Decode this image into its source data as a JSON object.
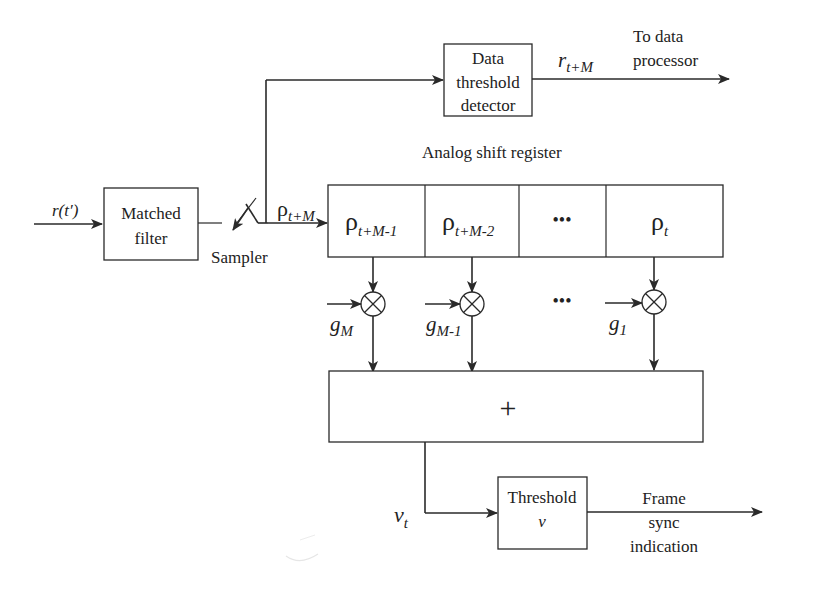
{
  "diagram": {
    "type": "block-diagram",
    "input": {
      "label": "r(t′)"
    },
    "matched_filter": {
      "line1": "Matched",
      "line2": "filter"
    },
    "sampler": {
      "label": "Sampler"
    },
    "sampled_signal": {
      "base": "ρ",
      "sub": "t+M"
    },
    "data_detector": {
      "line1": "Data",
      "line2": "threshold",
      "line3": "detector"
    },
    "data_output": {
      "base": "r",
      "sub": "t+M",
      "dest_line1": "To data",
      "dest_line2": "processor"
    },
    "shift_register": {
      "label": "Analog shift register",
      "cells": [
        {
          "base": "ρ",
          "sub": "t+M-1"
        },
        {
          "base": "ρ",
          "sub": "t+M-2"
        },
        {
          "base": "•••",
          "sub": ""
        },
        {
          "base": "ρ",
          "sub": "t"
        }
      ]
    },
    "weights": [
      {
        "base": "g",
        "sub": "M"
      },
      {
        "base": "g",
        "sub": "M-1"
      },
      {
        "base": "g",
        "sub": "1"
      }
    ],
    "weights_ellipsis": "•••",
    "summer": {
      "symbol": "+"
    },
    "correlator_output": {
      "base": "v",
      "sub": "t"
    },
    "threshold": {
      "line1": "Threshold",
      "line2": "v"
    },
    "final_output": {
      "line1": "Frame",
      "line2": "sync",
      "line3": "indication"
    },
    "colors": {
      "line": "#2a2a2a",
      "background": "#ffffff"
    }
  }
}
